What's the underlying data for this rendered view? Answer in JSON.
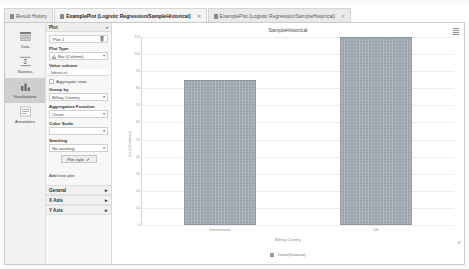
{
  "tabs": [
    {
      "label": "Result History",
      "icon": "history-icon",
      "closable": false,
      "active": false
    },
    {
      "label": "ExamplePlot (Logistic Regression/SampleHistorical)",
      "icon": "plot-icon",
      "closable": true,
      "active": true
    },
    {
      "label": "ExamplePlot (Logistic Regression/SampleHistorical)",
      "icon": "plot-icon",
      "closable": true,
      "active": false
    }
  ],
  "rail": {
    "items": [
      {
        "label": "Data",
        "icon": "table-icon",
        "selected": false
      },
      {
        "label": "Statistics",
        "icon": "sigma-icon",
        "selected": false
      },
      {
        "label": "Visualizations",
        "icon": "chart-icon",
        "selected": true
      },
      {
        "label": "Annotations",
        "icon": "notes-icon",
        "selected": false
      }
    ]
  },
  "settings": {
    "section_title": "Plot",
    "plot_name": "Plot 1",
    "plot_type": {
      "label": "Plot Type",
      "value": "Bar (Column)"
    },
    "value_column": {
      "label": "Value column",
      "value": "Idenacct"
    },
    "aggregate_rows": {
      "label": "Aggregate rows",
      "checked": true
    },
    "group_by": {
      "label": "Group by",
      "value": "Billing Country"
    },
    "aggregation_function": {
      "label": "Aggregation Function",
      "value": "Count"
    },
    "color_scale": {
      "label": "Color Scale",
      "value": ""
    },
    "stacking": {
      "label": "Stacking",
      "value": "No stacking"
    },
    "plot_style_button": "Plot style",
    "add_new_plot": "Add new plot",
    "collapsed_sections": [
      "General",
      "X Axis",
      "Y Axis"
    ],
    "chevron_down": "▾",
    "chevron_right": "▸"
  },
  "chart_data": {
    "type": "bar",
    "title": "SampleHistorical",
    "categories": [
      "International",
      "US"
    ],
    "values": [
      85,
      121
    ],
    "series": [
      {
        "name": "Count(Invoices)",
        "values": [
          85,
          121
        ]
      }
    ],
    "xlabel": "Billing Country",
    "ylabel": "Count(Invoices)",
    "ylim": [
      0,
      110
    ],
    "yticks": [
      110,
      100,
      90,
      80,
      70,
      60,
      50,
      40,
      30,
      20,
      10,
      0
    ],
    "legend": [
      "Count(Invoices)"
    ],
    "legend_position": "bottom",
    "grid": true,
    "bar_color": "#9aa3ad"
  },
  "accent_color": "#9aa3ad"
}
